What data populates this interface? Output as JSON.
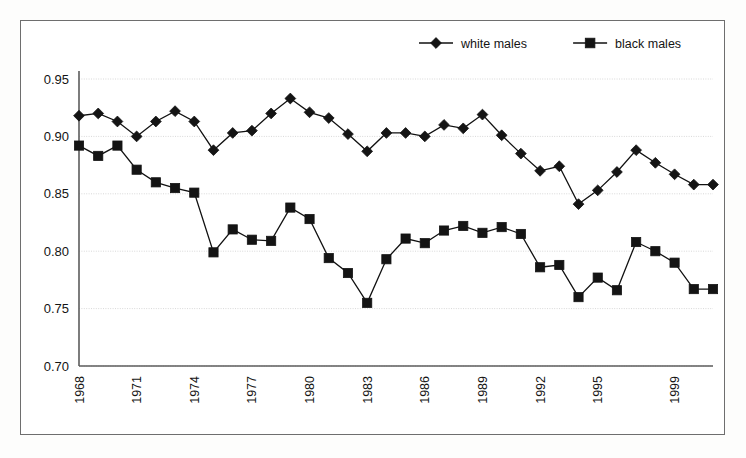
{
  "figure": {
    "name": "labor-force-participation-line-chart",
    "background_color": "#ffffff",
    "frame_color": "#6e6e6e",
    "series_color": "#141414"
  },
  "legend": {
    "position": "top-right",
    "entries": [
      {
        "label": "white males",
        "marker": "diamond-marker",
        "color": "#141414"
      },
      {
        "label": "black males",
        "marker": "square-marker",
        "color": "#141414"
      }
    ]
  },
  "axes": {
    "y": {
      "ticks": [
        "0.95",
        "0.90",
        "0.85",
        "0.80",
        "0.75",
        "0.70"
      ],
      "tick_values": [
        0.95,
        0.9,
        0.85,
        0.8,
        0.75,
        0.7
      ],
      "min": 0.7,
      "max": 0.95,
      "label": ""
    },
    "x": {
      "ticks": [
        "1968",
        "1971",
        "1974",
        "1977",
        "1980",
        "1983",
        "1986",
        "1989",
        "1992",
        "1995",
        "1999"
      ],
      "tick_years": [
        1968,
        1971,
        1974,
        1977,
        1980,
        1983,
        1986,
        1989,
        1992,
        1995,
        1999
      ],
      "min": 1968,
      "max": 2001,
      "label": "",
      "rotation": -90
    }
  },
  "chart_data": {
    "type": "line",
    "title": "",
    "xlabel": "",
    "ylabel": "",
    "xlim": [
      1968,
      2001
    ],
    "ylim": [
      0.7,
      0.95
    ],
    "grid": true,
    "legend_position": "top-right",
    "x": [
      1968,
      1969,
      1970,
      1971,
      1972,
      1973,
      1974,
      1975,
      1976,
      1977,
      1978,
      1979,
      1980,
      1981,
      1982,
      1983,
      1984,
      1985,
      1986,
      1987,
      1988,
      1989,
      1990,
      1991,
      1992,
      1993,
      1994,
      1995,
      1996,
      1997,
      1998,
      1999,
      2000,
      2001
    ],
    "categories": [
      "1968",
      "1969",
      "1970",
      "1971",
      "1972",
      "1973",
      "1974",
      "1975",
      "1976",
      "1977",
      "1978",
      "1979",
      "1980",
      "1981",
      "1982",
      "1983",
      "1984",
      "1985",
      "1986",
      "1987",
      "1988",
      "1989",
      "1990",
      "1991",
      "1992",
      "1993",
      "1994",
      "1995",
      "1996",
      "1997",
      "1998",
      "1999",
      "2000",
      "2001"
    ],
    "series": [
      {
        "name": "white males",
        "marker": "diamond",
        "color": "#141414",
        "values": [
          0.918,
          0.92,
          0.913,
          0.9,
          0.913,
          0.922,
          0.913,
          0.888,
          0.903,
          0.905,
          0.92,
          0.933,
          0.921,
          0.916,
          0.902,
          0.887,
          0.903,
          0.903,
          0.9,
          0.91,
          0.907,
          0.919,
          0.901,
          0.885,
          0.87,
          0.874,
          0.841,
          0.853,
          0.869,
          0.888,
          0.877,
          0.867,
          0.858,
          0.858
        ]
      },
      {
        "name": "black males",
        "marker": "square",
        "color": "#141414",
        "values": [
          0.892,
          0.883,
          0.892,
          0.871,
          0.86,
          0.855,
          0.851,
          0.799,
          0.819,
          0.81,
          0.809,
          0.838,
          0.828,
          0.794,
          0.781,
          0.755,
          0.793,
          0.811,
          0.807,
          0.818,
          0.822,
          0.816,
          0.821,
          0.815,
          0.786,
          0.788,
          0.76,
          0.777,
          0.766,
          0.808,
          0.8,
          0.79,
          0.767,
          0.767
        ]
      }
    ]
  }
}
